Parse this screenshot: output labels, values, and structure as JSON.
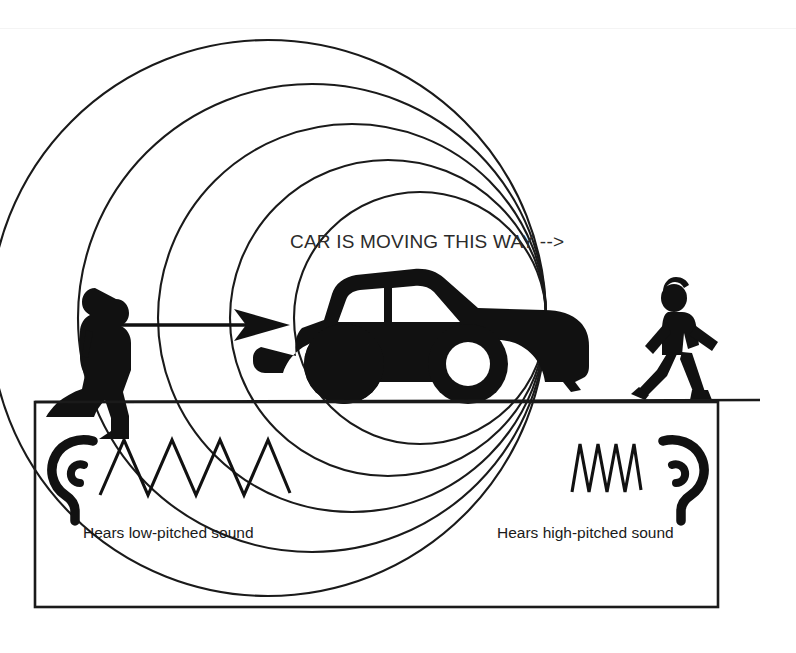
{
  "figure": {
    "title_text": "CAR IS MOVING THIS WAY -->",
    "background_color": "#ffffff",
    "ink_color": "#111111",
    "caption_color": "#2b2b2b"
  },
  "labels": {
    "left_observer": "Hears low-pitched sound",
    "right_observer": "Hears high-pitched sound"
  },
  "diagram_data": {
    "type": "diagram",
    "concept": "Doppler effect",
    "source": "car",
    "source_direction": "right",
    "wave_circles": [
      {
        "index": 1,
        "cx": 268,
        "cy": 318,
        "r": 278
      },
      {
        "index": 2,
        "cx": 312,
        "cy": 318,
        "r": 234
      },
      {
        "index": 3,
        "cx": 352,
        "cy": 318,
        "r": 194
      },
      {
        "index": 4,
        "cx": 388,
        "cy": 318,
        "r": 158
      },
      {
        "index": 5,
        "cx": 420,
        "cy": 318,
        "r": 126
      }
    ],
    "left_wave": {
      "peaks": 4,
      "wavelength": "long",
      "pitch": "low"
    },
    "right_wave": {
      "peaks": 4,
      "wavelength": "short",
      "pitch": "high"
    },
    "observers": [
      {
        "side": "left",
        "facing": "left",
        "hears": "low-pitched sound"
      },
      {
        "side": "right",
        "facing": "right",
        "hears": "high-pitched sound"
      }
    ],
    "ground_line_y": 402,
    "legend_box": {
      "x": 35,
      "y": 402,
      "width": 683,
      "height": 205
    }
  }
}
